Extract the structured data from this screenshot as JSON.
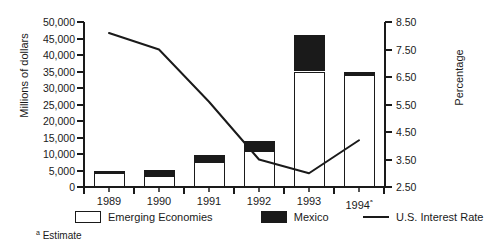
{
  "chart_data": {
    "type": "bar",
    "title": "",
    "subtitle": "",
    "categories": [
      "1989",
      "1990",
      "1991",
      "1992",
      "1993",
      "1994"
    ],
    "category_labels": [
      "1989",
      "1990",
      "1991",
      "1992",
      "1993",
      "1994ᵃ"
    ],
    "xlabel": "",
    "ylabel": "Millions of dollars",
    "y2label": "Percentage",
    "ylim": [
      0,
      50000
    ],
    "y2lim": [
      2.5,
      8.5
    ],
    "yticks": [
      0,
      5000,
      10000,
      15000,
      20000,
      25000,
      30000,
      35000,
      40000,
      45000,
      50000
    ],
    "ytick_labels": [
      "0",
      "5,000",
      "10,000",
      "15,000",
      "20,000",
      "25,000",
      "30,000",
      "35,000",
      "40,000",
      "45,000",
      "50,000"
    ],
    "y2ticks": [
      2.5,
      3.5,
      4.5,
      5.5,
      6.5,
      7.5,
      8.5
    ],
    "y2tick_labels": [
      "2.50",
      "3.50",
      "4.50",
      "5.50",
      "6.50",
      "7.50",
      "8.50"
    ],
    "grid": false,
    "stacked": true,
    "legend_position": "bottom",
    "series": [
      {
        "name": "Emerging Economies",
        "kind": "bar",
        "axis": "left",
        "color": "#ffffff",
        "edge_color": "#1a1a1a",
        "values": [
          4300,
          3400,
          7500,
          11000,
          35000,
          34000
        ]
      },
      {
        "name": "Mexico",
        "kind": "bar",
        "axis": "left",
        "color": "#1a1a1a",
        "edge_color": "#1a1a1a",
        "values": [
          700,
          1900,
          2200,
          3000,
          11000,
          1000
        ]
      },
      {
        "name": "U.S. Interest Rate",
        "kind": "line",
        "axis": "right",
        "color": "#1a1a1a",
        "values": [
          8.1,
          7.5,
          5.6,
          3.5,
          3.0,
          4.2
        ]
      }
    ],
    "totals": [
      5000,
      5300,
      9700,
      14000,
      46000,
      35000
    ],
    "annotations": [
      {
        "name": "estimate-footnote",
        "marker": "a",
        "text": "Estimate"
      }
    ]
  },
  "legend": {
    "items": [
      {
        "label": "Emerging Economies",
        "swatch": "white-box"
      },
      {
        "label": "Mexico",
        "swatch": "black-box"
      },
      {
        "label": "U.S. Interest Rate",
        "swatch": "line"
      }
    ]
  },
  "footnote": {
    "marker": "a",
    "text": "Estimate"
  }
}
